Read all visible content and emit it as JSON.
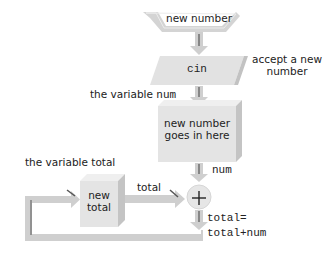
{
  "diagram": {
    "input_label": "new number",
    "input_box_label": "cin",
    "input_annotation": "accept a new number",
    "input_annotation_line1": "accept a new",
    "input_annotation_line2": "number",
    "num_variable_label_prefix": "the variable",
    "num_variable_name": "num",
    "num_box_line1": "new number",
    "num_box_line2": "goes in here",
    "num_flow_label": "num",
    "total_variable_label": "the variable total",
    "total_box_line1": "new",
    "total_box_line2": "total",
    "total_flow_label": "total",
    "adder_symbol": "+",
    "assignment_line1": "total=",
    "assignment_line2": "total+num"
  },
  "colors": {
    "box_face": "#e4e4e4",
    "box_side": "#c4c4c4",
    "box_top": "#efefef",
    "arrow": "#cfcfcf",
    "arrow_edge": "#555555",
    "text": "#222222"
  }
}
